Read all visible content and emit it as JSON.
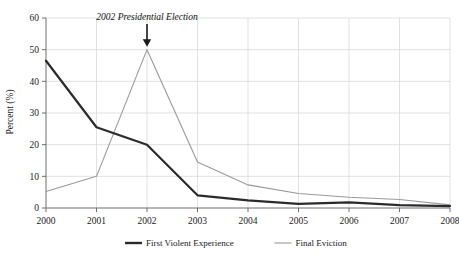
{
  "chart_data": {
    "type": "line",
    "title": "",
    "xlabel": "",
    "ylabel": "Percent (%)",
    "xlim": [
      2000,
      2008
    ],
    "ylim": [
      0,
      60
    ],
    "grid": true,
    "legend_position": "bottom",
    "categories": [
      "2000",
      "2001",
      "2002",
      "2003",
      "2004",
      "2005",
      "2006",
      "2007",
      "2008"
    ],
    "x": [
      2000,
      2001,
      2002,
      2003,
      2004,
      2005,
      2006,
      2007,
      2008
    ],
    "yticks": [
      0,
      10,
      20,
      30,
      40,
      50,
      60
    ],
    "series": [
      {
        "name": "First Violent Experience",
        "color": "#2b2b2b",
        "width": 2.2,
        "values": [
          46.5,
          25.5,
          20.0,
          4.0,
          2.4,
          1.3,
          1.8,
          0.9,
          0.6
        ]
      },
      {
        "name": "Final Eviction",
        "color": "#9a9a9a",
        "width": 1.1,
        "values": [
          5.2,
          10.0,
          50.0,
          14.5,
          7.3,
          4.6,
          3.4,
          2.7,
          1.0
        ]
      }
    ],
    "annotations": [
      {
        "text": "2002 Presidential Election",
        "at_x": 2002,
        "at_y": 50,
        "marker": "down-arrow"
      }
    ]
  },
  "axis": {
    "ylabel": "Percent (%)",
    "ytick_labels": [
      "0",
      "10",
      "20",
      "30",
      "40",
      "50",
      "60"
    ],
    "xtick_labels": [
      "2000",
      "2001",
      "2002",
      "2003",
      "2004",
      "2005",
      "2006",
      "2007",
      "2008"
    ]
  },
  "annotation": {
    "label": "2002 Presidential Election"
  },
  "legend": {
    "items": [
      {
        "label": "First Violent Experience",
        "color": "#2b2b2b"
      },
      {
        "label": "Final Eviction",
        "color": "#9a9a9a"
      }
    ]
  },
  "colors": {
    "series_primary": "#2b2b2b",
    "series_secondary": "#9a9a9a",
    "grid": "#d4d4d4",
    "axis": "#6e6e6e",
    "text": "#1a1a1a",
    "background": "#ffffff"
  }
}
